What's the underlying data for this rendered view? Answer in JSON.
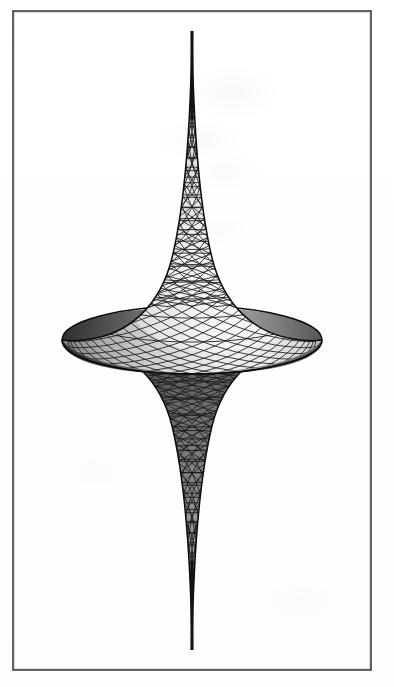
{
  "page": {
    "width": 394,
    "height": 687,
    "background_color": "#ffffff",
    "media": "scanned-book-figure"
  },
  "frame": {
    "name": "figure-border",
    "x": 13,
    "y": 11,
    "width": 358,
    "height": 659,
    "stroke_color": "#3a3a3a",
    "stroke_width": 1.6,
    "fill": "none"
  },
  "figure": {
    "render_style": "shaded wireframe mesh",
    "palette": {
      "mesh_line": "#1a1a1a",
      "highlight": "#f2f2f2",
      "midtone": "#a8a8a8",
      "shadow": "#4a4a4a",
      "deep_shadow": "#242424",
      "outline": "#101010",
      "background": "#ffffff"
    },
    "geometry": {
      "axis_x": 192,
      "top_cusp_y": 31,
      "bottom_cusp_y": 650,
      "equator_y": 340,
      "equator_left_x": 62,
      "equator_right_x": 312,
      "max_radius_px": 125,
      "equator_ellipse_ry": 34,
      "upper_lobe_height": 309,
      "lower_lobe_height": 310,
      "cusp_half_width_px": 3
    },
    "mesh": {
      "meridian_count": 32,
      "parallel_count_upper": 22,
      "parallel_count_lower": 22,
      "pattern": "diamond lattice from two crossing helical families",
      "helix_twist_turns": 0.62,
      "line_width": 0.85
    },
    "shading": {
      "light_direction": "upper-right",
      "upper_lobe": "bright, highlight centered right-of-axis",
      "lower_lobe": "dark, in shadow with faint lower highlight",
      "left_equator_rim": "dark",
      "right_equator_rim": "mid-dark"
    }
  },
  "chart_data": {
    "type": "line",
    "xlabel": "radius r",
    "ylabel": "axial height z",
    "parametrization": {
      "r(u)": "a * sin(u)",
      "z(u)": "a * ( cos(u) + ln( tan(u/2) ) )",
      "a": 1.0,
      "u_range_deg": [
        4,
        90
      ],
      "v_range_deg": [
        0,
        360
      ]
    },
    "axis_ranges": {
      "r": [
        0,
        1
      ],
      "z": [
        -2.5,
        2.5
      ]
    },
    "grid": false,
    "legend": "none",
    "profile_points_r": [
      0.07,
      0.14,
      0.21,
      0.28,
      0.34,
      0.41,
      0.47,
      0.53,
      0.59,
      0.64,
      0.7,
      0.75,
      0.79,
      0.84,
      0.88,
      0.91,
      0.94,
      0.96,
      0.98,
      0.99,
      1.0
    ],
    "profile_points_z": [
      2.46,
      1.96,
      1.67,
      1.46,
      1.29,
      1.15,
      1.02,
      0.91,
      0.81,
      0.72,
      0.63,
      0.55,
      0.47,
      0.4,
      0.33,
      0.26,
      0.2,
      0.14,
      0.09,
      0.04,
      0.0
    ]
  }
}
